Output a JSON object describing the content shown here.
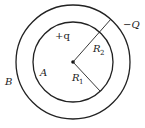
{
  "diagram": {
    "center": {
      "x": 73,
      "y": 62
    },
    "inner_sphere": {
      "label": "A",
      "radius_label": "R",
      "radius_sub": "1",
      "charge": "+q",
      "r_px": 40
    },
    "outer_sphere": {
      "label": "B",
      "radius_label": "R",
      "radius_sub": "2",
      "charge": "−Q",
      "r_px": 57
    },
    "labels": {
      "charge_inner": "+q",
      "charge_outer": "−Q",
      "region_A": "A",
      "region_B": "B",
      "R1_main": "R",
      "R1_sub": "1",
      "R2_main": "R",
      "R2_sub": "2"
    },
    "colors": {
      "stroke": "#222222",
      "background": "#ffffff"
    }
  }
}
